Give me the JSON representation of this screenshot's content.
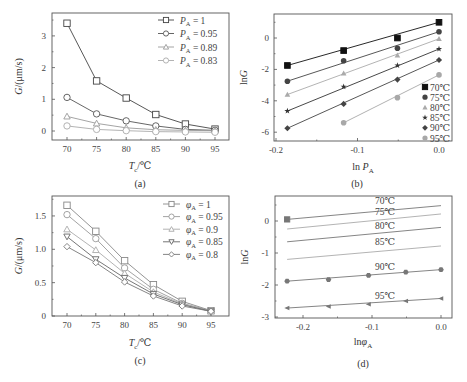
{
  "chart_data": [
    {
      "panel": "a",
      "caption": "(a)",
      "type": "line",
      "xlabel": "Tc/℃",
      "ylabel": "G/(μm/s)",
      "x": [
        70,
        75,
        80,
        85,
        90,
        95
      ],
      "xticks": [
        "70",
        "75",
        "80",
        "85",
        "90",
        "95"
      ],
      "yticks": [
        "0",
        "1",
        "2",
        "3"
      ],
      "ylim": [
        -0.25,
        3.6
      ],
      "legend_position": "upper right",
      "series": [
        {
          "name": "PA = 1",
          "marker": "square",
          "color": "#444444",
          "values": [
            3.4,
            1.58,
            1.04,
            0.52,
            0.22,
            0.06
          ]
        },
        {
          "name": "PA = 0.95",
          "marker": "circle",
          "color": "#555555",
          "values": [
            1.06,
            0.54,
            0.32,
            0.16,
            0.05,
            0.02
          ]
        },
        {
          "name": "PA = 0.89",
          "marker": "triangle",
          "color": "#9a9a9a",
          "values": [
            0.46,
            0.24,
            0.1,
            0.04,
            0.02,
            0.01
          ]
        },
        {
          "name": "PA = 0.83",
          "marker": "circle",
          "color": "#aaaaaa",
          "values": [
            0.16,
            0.05,
            0.01,
            -0.02,
            -0.03,
            -0.04
          ]
        }
      ]
    },
    {
      "panel": "b",
      "caption": "(b)",
      "type": "scatter",
      "xlabel": "ln PA",
      "ylabel": "lnG",
      "xticks": [
        "-0.2",
        "-0.1",
        "0.0"
      ],
      "yticks": [
        "-6",
        "-4",
        "-2",
        "0"
      ],
      "xlim": [
        -0.205,
        0.015
      ],
      "ylim": [
        -6.5,
        1.5
      ],
      "legend_position": "lower right",
      "series": [
        {
          "name": "70℃",
          "marker": "filled-square",
          "color": "#111111",
          "x": [
            -0.186,
            -0.117,
            -0.051,
            0.0
          ],
          "values": [
            -1.75,
            -0.8,
            0.0,
            1.0
          ]
        },
        {
          "name": "75℃",
          "marker": "filled-circle",
          "color": "#444444",
          "x": [
            -0.186,
            -0.117,
            -0.051,
            0.0
          ],
          "values": [
            -2.75,
            -1.45,
            -0.65,
            0.4
          ]
        },
        {
          "name": "80℃",
          "marker": "filled-triangle",
          "color": "#aaaaaa",
          "x": [
            -0.186,
            -0.117,
            -0.051,
            0.0
          ],
          "values": [
            -3.6,
            -2.25,
            -1.1,
            -0.05
          ]
        },
        {
          "name": "85℃",
          "marker": "filled-star",
          "color": "#333333",
          "x": [
            -0.186,
            -0.117,
            -0.051,
            0.0
          ],
          "values": [
            -4.65,
            -3.1,
            -1.75,
            -0.7
          ]
        },
        {
          "name": "90℃",
          "marker": "filled-diamond",
          "color": "#444444",
          "x": [
            -0.186,
            -0.117,
            -0.051,
            0.0
          ],
          "values": [
            -5.75,
            -4.2,
            -2.65,
            -1.4
          ]
        },
        {
          "name": "95℃",
          "marker": "filled-circle",
          "color": "#a8a8a8",
          "x": [
            -0.117,
            -0.051,
            0.0
          ],
          "values": [
            -5.4,
            -3.8,
            -2.35
          ]
        }
      ]
    },
    {
      "panel": "c",
      "caption": "(c)",
      "type": "line",
      "xlabel": "Tc/℃",
      "ylabel": "G/(μm/s)",
      "x": [
        70,
        75,
        80,
        85,
        90,
        95
      ],
      "xticks": [
        "70",
        "75",
        "80",
        "85",
        "90",
        "95"
      ],
      "yticks": [
        "0",
        "0.5",
        "1.0",
        "1.5"
      ],
      "ylim": [
        0,
        1.78
      ],
      "legend_position": "upper right",
      "series": [
        {
          "name": "φA = 1",
          "marker": "square",
          "color": "#888888",
          "values": [
            1.66,
            1.27,
            0.83,
            0.47,
            0.22,
            0.08
          ]
        },
        {
          "name": "φA = 0.95",
          "marker": "circle",
          "color": "#999999",
          "values": [
            1.52,
            1.16,
            0.72,
            0.4,
            0.19,
            0.08
          ]
        },
        {
          "name": "φA = 0.9",
          "marker": "triangle",
          "color": "#aaaaaa",
          "values": [
            1.3,
            0.99,
            0.64,
            0.36,
            0.18,
            0.07
          ]
        },
        {
          "name": "φA = 0.85",
          "marker": "down-triangle",
          "color": "#666666",
          "values": [
            1.19,
            0.85,
            0.57,
            0.33,
            0.17,
            0.07
          ]
        },
        {
          "name": "φA = 0.8",
          "marker": "diamond",
          "color": "#777777",
          "values": [
            1.04,
            0.8,
            0.51,
            0.3,
            0.15,
            0.07
          ]
        }
      ]
    },
    {
      "panel": "d",
      "caption": "(d)",
      "type": "scatter",
      "xlabel": "lnφA",
      "ylabel": "lnG",
      "xticks": [
        "-0.2",
        "-0.1",
        "0.0"
      ],
      "yticks": [
        "-3",
        "-2",
        "-1",
        "0"
      ],
      "xlim": [
        -0.24,
        0.016
      ],
      "ylim": [
        -3,
        0.75
      ],
      "annotations": [
        "70℃",
        "75℃",
        "80℃",
        "85℃",
        "90℃",
        "95℃"
      ],
      "series": [
        {
          "name": "70℃",
          "marker": "filled-square",
          "color": "#777777",
          "x": [
            -0.223,
            0.0
          ],
          "values": [
            0.05,
            0.48
          ],
          "points_shown": [
            [
              -0.223,
              0.05
            ]
          ]
        },
        {
          "name": "75℃",
          "marker": "none",
          "color": "#aaaaaa",
          "x": [
            -0.223,
            0.0
          ],
          "values": [
            -0.25,
            0.22
          ]
        },
        {
          "name": "80℃",
          "marker": "none",
          "color": "#777777",
          "x": [
            -0.223,
            0.0
          ],
          "values": [
            -0.65,
            -0.2
          ]
        },
        {
          "name": "85℃",
          "marker": "none",
          "color": "#aaaaaa",
          "x": [
            -0.223,
            0.0
          ],
          "values": [
            -1.2,
            -0.78
          ]
        },
        {
          "name": "90℃",
          "marker": "filled-hexagon",
          "color": "#777777",
          "x": [
            -0.223,
            -0.163,
            -0.105,
            -0.051,
            0.0
          ],
          "values": [
            -1.88,
            -1.83,
            -1.7,
            -1.6,
            -1.52
          ]
        },
        {
          "name": "95℃",
          "marker": "filled-left-triangle",
          "color": "#777777",
          "x": [
            -0.223,
            -0.163,
            -0.105,
            -0.051,
            0.0
          ],
          "values": [
            -2.72,
            -2.67,
            -2.6,
            -2.5,
            -2.42
          ]
        }
      ]
    }
  ],
  "labels": {
    "a": {
      "caption": "(a)",
      "ylabel": "G/(μm/s)",
      "xlabel_main": "T",
      "xlabel_sub": "c",
      "xlabel_unit": "/℃",
      "legend": [
        {
          "sym": "P",
          "sub": "A",
          "val": " = 1"
        },
        {
          "sym": "P",
          "sub": "A",
          "val": " = 0.95"
        },
        {
          "sym": "P",
          "sub": "A",
          "val": " = 0.89"
        },
        {
          "sym": "P",
          "sub": "A",
          "val": " = 0.83"
        }
      ]
    },
    "b": {
      "caption": "(b)",
      "ylabel": "lnG",
      "xlabel_main": "ln P",
      "xlabel_sub": "A",
      "legend": [
        "70℃",
        "75℃",
        "80℃",
        "85℃",
        "90℃",
        "95℃"
      ]
    },
    "c": {
      "caption": "(c)",
      "ylabel": "G/(μm/s)",
      "xlabel_main": "T",
      "xlabel_sub": "c",
      "xlabel_unit": "/℃",
      "legend": [
        {
          "sym": "φ",
          "sub": "A",
          "val": " = 1"
        },
        {
          "sym": "φ",
          "sub": "A",
          "val": " = 0.95"
        },
        {
          "sym": "φ",
          "sub": "A",
          "val": " = 0.9"
        },
        {
          "sym": "φ",
          "sub": "A",
          "val": " = 0.85"
        },
        {
          "sym": "φ",
          "sub": "A",
          "val": " = 0.8"
        }
      ]
    },
    "d": {
      "caption": "(d)",
      "ylabel": "lnG",
      "xlabel_main": "lnφ",
      "xlabel_sub": "A",
      "annotations": [
        "70℃",
        "75℃",
        "80℃",
        "85℃",
        "90℃",
        "95℃"
      ]
    }
  }
}
